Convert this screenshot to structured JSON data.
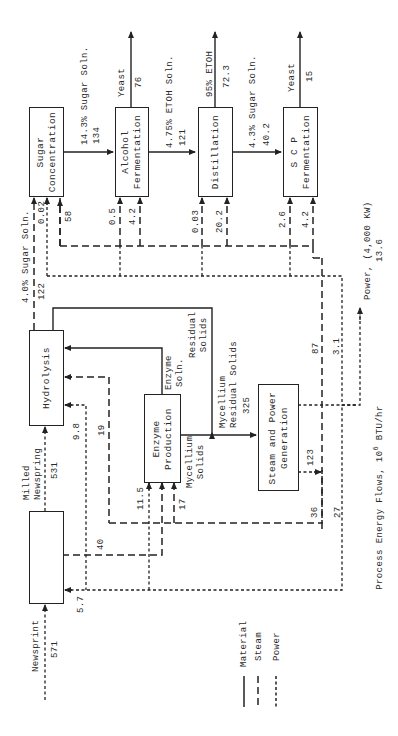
{
  "figure": {
    "caption": "Process Energy Flows, 10",
    "caption_sup": "6",
    "caption_unit": "BTU/hr"
  },
  "boxes": {
    "sugar_concentration": "Sugar\nConcentration",
    "alcohol_fermentation": "Alcohol\nFermentation",
    "distillation": "Distillation",
    "scp_fermentation": "S C P\nFermentation",
    "hydrolysis": "Hydrolysis",
    "enzyme_production": "Enzyme\nProduction",
    "steam_power": "Steam and Power\nGeneration",
    "milling": ""
  },
  "streams": {
    "newsprint": {
      "label": "Newsprint",
      "value": "571"
    },
    "milled_newsprint": {
      "label": "Milled\nNewspring",
      "value": "531"
    },
    "sugar_4pct": {
      "label": "4.0% Sugar Soln.",
      "value": "122"
    },
    "sugar_14pct": {
      "label": "14.3% Sugar Soln.",
      "value": "134"
    },
    "yeast_af": {
      "label": "Yeast",
      "value": "76"
    },
    "etoh_soln": {
      "label": "4.75% ETOH Soln.",
      "value": "121"
    },
    "etoh_95": {
      "label": "95% ETOH",
      "value": "72.3"
    },
    "sugar_4_3pct": {
      "label": "4.3% Sugar Soln.",
      "value": "40.2"
    },
    "yeast_scp": {
      "label": "Yeast",
      "value": "15"
    },
    "enzyme_soln": {
      "label": "Enzyme\nSoln."
    },
    "residual_solids": {
      "label": "Residual\nSolids"
    },
    "mycellium_residual": {
      "label": "Mycellium\nResidual Solids",
      "value": "325"
    },
    "mycellium_solids": {
      "label": "Mycellium\nSolids"
    },
    "power_out": {
      "label": "Power, (4,000 KW)",
      "value": "13.6"
    }
  },
  "energy_values": {
    "sc_a": "0.02",
    "sc_b": "58",
    "af_a": "0.5",
    "af_b": "4.2",
    "di_a": "0.03",
    "di_b": "20.2",
    "scp_a": "2.6",
    "scp_b": "4.2",
    "hy_a": "9.8",
    "hy_b": "19",
    "ep_a": "11.5",
    "ep_b": "17",
    "mill_a": "40",
    "mill_b": "5.7",
    "steam_total": "123",
    "steam_87": "87",
    "power_3_1": "3.1",
    "steam_36": "36",
    "power_27": "27"
  },
  "legend": {
    "material": "Material",
    "steam": "Steam",
    "power": "Power"
  }
}
